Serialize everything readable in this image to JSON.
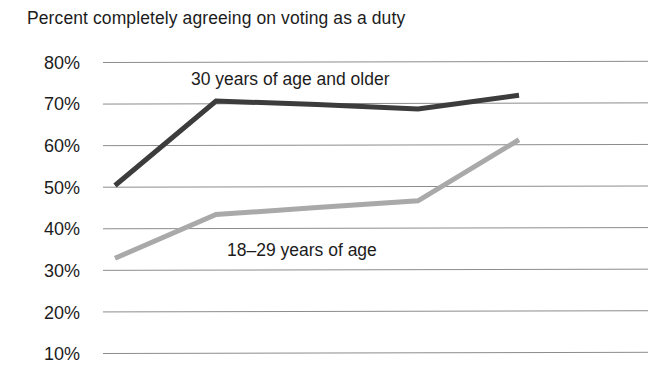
{
  "chart_data": {
    "type": "line",
    "title": "Percent completely agreeing on voting as a duty",
    "xlabel": "",
    "ylabel": "",
    "ylim": [
      5,
      84
    ],
    "yticks": [
      80,
      70,
      60,
      50,
      40,
      30,
      20,
      10
    ],
    "ytick_labels": [
      "80%",
      "70%",
      "60%",
      "50%",
      "40%",
      "30%",
      "20%",
      "10%"
    ],
    "grid": true,
    "legend_position": "inline-annotation",
    "x": [
      0,
      1,
      2,
      3,
      4
    ],
    "series": [
      {
        "name": "30 years of age and older",
        "color": "#3c3c3c",
        "values": [
          50.3,
          70.6,
          69.8,
          68.7,
          72.0
        ]
      },
      {
        "name": "18–29 years of age",
        "color": "#a9a9a9",
        "values": [
          32.8,
          43.3,
          45.0,
          46.6,
          61.3
        ]
      }
    ],
    "annotations": [
      {
        "text": "30 years of age and older"
      },
      {
        "text": "18–29 years of age"
      }
    ]
  },
  "colors": {
    "older_line": "#3c3c3c",
    "younger_line": "#a9a9a9",
    "gridline": "#8c8c8c",
    "text": "#1c1c1c",
    "background": "#ffffff"
  }
}
